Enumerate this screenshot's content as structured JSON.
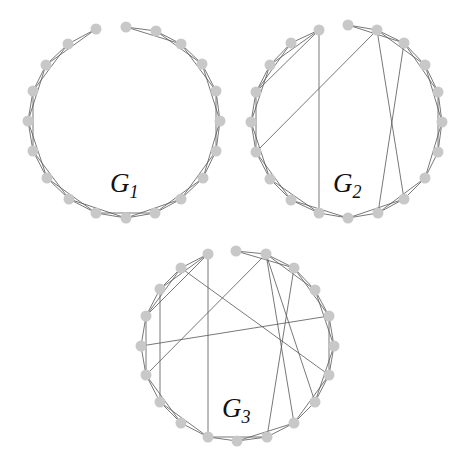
{
  "figure": {
    "node_color": "#c8c8c8",
    "edge_color": "#555555",
    "node_radius": 5.5
  },
  "graphs": [
    {
      "id": "g1",
      "label_main": "G",
      "label_sub": "1",
      "label_pos": [
        110,
        192
      ],
      "nodes": [
        [
          126,
          27
        ],
        [
          156,
          31
        ],
        [
          181,
          44
        ],
        [
          202,
          64
        ],
        [
          216,
          91
        ],
        [
          220,
          121
        ],
        [
          216,
          151
        ],
        [
          203,
          178
        ],
        [
          181,
          199
        ],
        [
          155,
          213
        ],
        [
          126,
          218
        ],
        [
          96,
          213
        ],
        [
          69,
          199
        ],
        [
          47,
          178
        ],
        [
          33,
          151
        ],
        [
          28,
          121
        ],
        [
          33,
          91
        ],
        [
          46,
          65
        ],
        [
          68,
          44
        ],
        [
          96,
          29
        ]
      ],
      "edges": [
        [
          0,
          1
        ],
        [
          0,
          2
        ],
        [
          1,
          2
        ],
        [
          1,
          3
        ],
        [
          2,
          3
        ],
        [
          2,
          4
        ],
        [
          3,
          4
        ],
        [
          3,
          5
        ],
        [
          4,
          5
        ],
        [
          4,
          6
        ],
        [
          5,
          6
        ],
        [
          5,
          7
        ],
        [
          6,
          7
        ],
        [
          6,
          8
        ],
        [
          7,
          8
        ],
        [
          7,
          9
        ],
        [
          8,
          9
        ],
        [
          8,
          10
        ],
        [
          9,
          10
        ],
        [
          9,
          11
        ],
        [
          10,
          11
        ],
        [
          10,
          12
        ],
        [
          11,
          12
        ],
        [
          11,
          13
        ],
        [
          12,
          13
        ],
        [
          12,
          14
        ],
        [
          13,
          14
        ],
        [
          13,
          15
        ],
        [
          14,
          15
        ],
        [
          14,
          16
        ],
        [
          15,
          16
        ],
        [
          15,
          17
        ],
        [
          16,
          17
        ],
        [
          16,
          18
        ],
        [
          17,
          18
        ],
        [
          17,
          19
        ],
        [
          18,
          19
        ]
      ]
    },
    {
      "id": "g2",
      "label_main": "G",
      "label_sub": "2",
      "label_pos": [
        333,
        192
      ],
      "nodes": [
        [
          348,
          25
        ],
        [
          377,
          30
        ],
        [
          404,
          43
        ],
        [
          425,
          65
        ],
        [
          438,
          92
        ],
        [
          442,
          122
        ],
        [
          438,
          152
        ],
        [
          425,
          178
        ],
        [
          404,
          199
        ],
        [
          378,
          213
        ],
        [
          348,
          218
        ],
        [
          319,
          213
        ],
        [
          291,
          200
        ],
        [
          270,
          179
        ],
        [
          256,
          152
        ],
        [
          251,
          122
        ],
        [
          256,
          92
        ],
        [
          270,
          65
        ],
        [
          291,
          43
        ],
        [
          319,
          30
        ]
      ],
      "edges": [
        [
          0,
          1
        ],
        [
          0,
          2
        ],
        [
          1,
          2
        ],
        [
          1,
          3
        ],
        [
          2,
          3
        ],
        [
          2,
          4
        ],
        [
          3,
          4
        ],
        [
          3,
          5
        ],
        [
          4,
          5
        ],
        [
          4,
          6
        ],
        [
          5,
          6
        ],
        [
          5,
          7
        ],
        [
          6,
          7
        ],
        [
          7,
          8
        ],
        [
          7,
          9
        ],
        [
          8,
          9
        ],
        [
          8,
          10
        ],
        [
          9,
          10
        ],
        [
          10,
          11
        ],
        [
          10,
          12
        ],
        [
          11,
          12
        ],
        [
          11,
          13
        ],
        [
          12,
          13
        ],
        [
          12,
          14
        ],
        [
          13,
          14
        ],
        [
          13,
          15
        ],
        [
          14,
          15
        ],
        [
          14,
          16
        ],
        [
          15,
          16
        ],
        [
          15,
          17
        ],
        [
          16,
          17
        ],
        [
          16,
          18
        ],
        [
          17,
          18
        ],
        [
          17,
          19
        ],
        [
          18,
          19
        ],
        [
          19,
          16
        ],
        [
          19,
          11
        ],
        [
          1,
          14
        ],
        [
          1,
          8
        ],
        [
          2,
          9
        ]
      ]
    },
    {
      "id": "g3",
      "label_main": "G",
      "label_sub": "3",
      "label_pos": [
        222,
        417
      ],
      "nodes": [
        [
          236,
          251
        ],
        [
          266,
          254
        ],
        [
          294,
          268
        ],
        [
          315,
          290
        ],
        [
          329,
          316
        ],
        [
          334,
          346
        ],
        [
          329,
          375
        ],
        [
          315,
          402
        ],
        [
          294,
          423
        ],
        [
          267,
          437
        ],
        [
          237,
          441
        ],
        [
          208,
          437
        ],
        [
          181,
          423
        ],
        [
          160,
          402
        ],
        [
          146,
          375
        ],
        [
          141,
          346
        ],
        [
          146,
          316
        ],
        [
          160,
          289
        ],
        [
          181,
          268
        ],
        [
          208,
          254
        ]
      ],
      "edges": [
        [
          0,
          1
        ],
        [
          0,
          2
        ],
        [
          1,
          2
        ],
        [
          1,
          3
        ],
        [
          2,
          3
        ],
        [
          2,
          4
        ],
        [
          3,
          4
        ],
        [
          3,
          5
        ],
        [
          4,
          5
        ],
        [
          4,
          6
        ],
        [
          5,
          6
        ],
        [
          5,
          7
        ],
        [
          6,
          7
        ],
        [
          6,
          8
        ],
        [
          7,
          8
        ],
        [
          8,
          9
        ],
        [
          8,
          10
        ],
        [
          9,
          10
        ],
        [
          9,
          11
        ],
        [
          10,
          11
        ],
        [
          11,
          12
        ],
        [
          11,
          13
        ],
        [
          12,
          13
        ],
        [
          12,
          14
        ],
        [
          13,
          14
        ],
        [
          14,
          15
        ],
        [
          14,
          16
        ],
        [
          15,
          16
        ],
        [
          16,
          17
        ],
        [
          16,
          18
        ],
        [
          17,
          18
        ],
        [
          18,
          19
        ],
        [
          19,
          17
        ],
        [
          19,
          16
        ],
        [
          19,
          11
        ],
        [
          18,
          6
        ],
        [
          17,
          13
        ],
        [
          15,
          4
        ],
        [
          14,
          1
        ],
        [
          1,
          8
        ],
        [
          1,
          7
        ],
        [
          2,
          9
        ]
      ]
    }
  ]
}
